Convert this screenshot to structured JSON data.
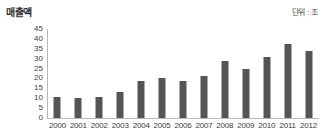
{
  "chart_data": {
    "type": "bar",
    "title": "매출액",
    "subtitle": "단위 : 조",
    "xlabel": "",
    "ylabel": "매출액",
    "unit": "조",
    "categories": [
      "2000",
      "2001",
      "2002",
      "2003",
      "2004",
      "2005",
      "2006",
      "2007",
      "2008",
      "2009",
      "2010",
      "2011",
      "2012"
    ],
    "values": [
      10.5,
      10,
      10.5,
      13,
      18.5,
      20,
      18.5,
      21,
      29,
      25,
      31,
      37.5,
      34
    ],
    "ylim": [
      0,
      45
    ],
    "yticks": [
      0,
      5,
      10,
      15,
      20,
      25,
      30,
      35,
      40,
      45
    ],
    "ytick_labels": [
      "0",
      "5",
      "10",
      "15",
      "20",
      "25",
      "30",
      "35",
      "40",
      "45"
    ],
    "grid": false,
    "legend": false,
    "series": [
      {
        "name": "매출액",
        "color": "#555555",
        "values": [
          10.5,
          10,
          10.5,
          13,
          18.5,
          20,
          18.5,
          21,
          29,
          25,
          31,
          37.5,
          34
        ]
      }
    ]
  },
  "colors": {
    "bar": "#555555",
    "axis": "#b9b9b9",
    "text": "#3c3c3c",
    "background": "#ffffff"
  }
}
